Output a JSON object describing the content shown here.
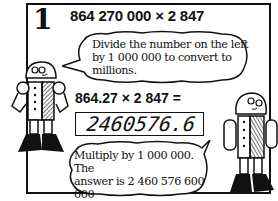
{
  "step": {
    "number": "1",
    "problem": "864 270 000 × 2 847"
  },
  "bubble_top": {
    "lines": [
      "Divide the number on the left",
      "by 1 000 000 to convert to",
      "millions."
    ]
  },
  "equation": "864.27 × 2 847 =",
  "calculator_display": "2460576.6",
  "bubble_bottom": {
    "lines": [
      "Multiply by 1 000 000. The",
      "answer is 2 460 576 600 000",
      "or about 2½ million million."
    ]
  },
  "robots": [
    {
      "name": "left-robot"
    },
    {
      "name": "right-robot"
    }
  ]
}
